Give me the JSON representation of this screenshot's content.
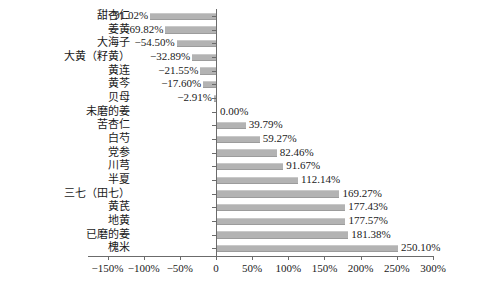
{
  "chart_data": {
    "type": "bar",
    "orientation": "horizontal",
    "title": "",
    "subtitle": "",
    "xlabel": "",
    "ylabel": "",
    "xlim": [
      -150,
      300
    ],
    "grid": false,
    "legend": null,
    "bar_color": "#b3b3b3",
    "axis_color": "#6b6b6b",
    "xticks": [
      -150,
      -100,
      -50,
      0,
      50,
      100,
      150,
      200,
      250,
      300
    ],
    "xtick_labels": [
      "-150%",
      "-100%",
      "-50%",
      "0",
      "50%",
      "100%",
      "150%",
      "200%",
      "250%",
      "300%"
    ],
    "categories": [
      "甜杏仁",
      "姜黄",
      "大海子",
      "大黄（籽黄）",
      "黄连",
      "黄芩",
      "贝母",
      "未磨的姜",
      "苦杏仁",
      "白芍",
      "党参",
      "川芎",
      "半夏",
      "三七（田七）",
      "黄芪",
      "地黄",
      "已磨的姜",
      "槐米"
    ],
    "values": [
      -91.02,
      -69.82,
      -54.5,
      -32.89,
      -21.55,
      -17.6,
      -2.91,
      0.0,
      39.79,
      59.27,
      82.46,
      91.67,
      112.14,
      169.27,
      177.43,
      177.57,
      181.38,
      250.1
    ],
    "value_labels": [
      "−91.02%",
      "−69.82%",
      "−54.50%",
      "−32.89%",
      "−21.55%",
      "−17.60%",
      "−2.91%",
      "0.00%",
      "39.79%",
      "59.27%",
      "82.46%",
      "91.67%",
      "112.14%",
      "169.27%",
      "177.43%",
      "177.57%",
      "181.38%",
      "250.10%"
    ]
  }
}
